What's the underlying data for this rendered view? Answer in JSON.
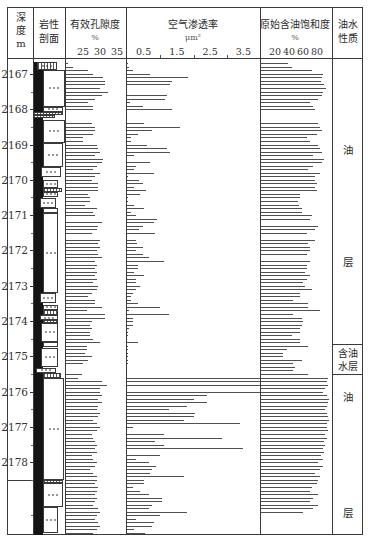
{
  "header": {
    "depth": {
      "line1": "深",
      "line2": "度",
      "unit": "m"
    },
    "lithology": {
      "line1": "岩性",
      "line2": "剖面"
    },
    "porosity": {
      "title": "有效孔隙度",
      "unit": "%"
    },
    "permeability": {
      "title": "空气渗透率",
      "unit": "μm²"
    },
    "saturation": {
      "title": "原始含油饱和度",
      "unit": "%"
    },
    "fluid": {
      "line1": "油水",
      "line2": "性质"
    }
  },
  "chart_data": {
    "type": "bar",
    "orientation": "horizontal",
    "layout": "well-log",
    "title": "",
    "ylabel": "深度 (m)",
    "depth_range": [
      2166.55,
      2180.06
    ],
    "depth_ticks": [
      2167,
      2168,
      2169,
      2170,
      2171,
      2172,
      2173,
      2174,
      2175,
      2176,
      2177,
      2178
    ],
    "depth_minor_step": 0.5,
    "section_break_depth": 2178.5,
    "sample_start": 2166.6,
    "sample_step": 0.1,
    "grid": false,
    "tracks": [
      {
        "key": "porosity",
        "name": "有效孔隙度",
        "unit": "%",
        "scale": [
          20,
          37.6
        ],
        "ticks": [
          25,
          30,
          35
        ],
        "tick_labels": [
          "25",
          "30",
          "35"
        ],
        "values": [
          null,
          20.6,
          22.1,
          26.5,
          27.9,
          30.9,
          31.5,
          31.5,
          30.0,
          32.4,
          30.6,
          28.5,
          26.5,
          27.9,
          27.9,
          null,
          null,
          null,
          27.6,
          28.5,
          28.5,
          27.9,
          25.0,
          25.0,
          29.1,
          29.4,
          30.0,
          28.5,
          30.9,
          30.6,
          29.1,
          27.9,
          30.0,
          28.5,
          27.6,
          29.4,
          29.4,
          29.4,
          26.5,
          27.1,
          27.1,
          25.6,
          29.1,
          27.9,
          28.5,
          null,
          30.6,
          29.4,
          29.1,
          27.6,
          null,
          30.0,
          29.4,
          30.0,
          29.1,
          29.4,
          30.6,
          28.5,
          29.1,
          28.5,
          29.1,
          28.5,
          29.1,
          27.9,
          29.4,
          29.1,
          27.6,
          26.5,
          28.5,
          28.5,
          30.6,
          26.2,
          31.5,
          31.5,
          27.6,
          27.1,
          27.6,
          27.1,
          27.1,
          27.9,
          30.0,
          26.2,
          26.2,
          25.6,
          27.6,
          26.5,
          25.0,
          null,
          null,
          24.7,
          23.5,
          30.6,
          32.1,
          30.0,
          30.0,
          30.6,
          29.4,
          30.6,
          29.4,
          29.1,
          30.0,
          29.4,
          27.9,
          29.1,
          30.0,
          29.1,
          27.6,
          27.9,
          28.5,
          29.1,
          28.5,
          29.1,
          27.6,
          27.9,
          29.1,
          28.5,
          27.1,
          27.9,
          29.1,
          29.1,
          28.5,
          29.4,
          29.1,
          28.5,
          29.1,
          28.5,
          27.9,
          29.4,
          30.0,
          29.1,
          28.5,
          29.4,
          30.0,
          29.1,
          27.9
        ]
      },
      {
        "key": "permeability",
        "name": "空气渗透率",
        "unit": "μm²",
        "scale": [
          0,
          4.0
        ],
        "ticks": [
          0.5,
          1.5,
          2.5,
          3.5
        ],
        "tick_labels": [
          "0.5",
          "1.5",
          "2.5",
          "3.5"
        ],
        "minor_ticks": [
          1,
          2,
          3
        ],
        "values": [
          null,
          0.03,
          0.06,
          0.17,
          0.7,
          1.83,
          1.35,
          1.3,
          null,
          null,
          1.2,
          1.15,
          0.1,
          0.47,
          1.35,
          null,
          null,
          null,
          0.5,
          1.6,
          0.75,
          0.32,
          0.12,
          0.12,
          0.6,
          1.2,
          1.3,
          0.2,
          null,
          0.7,
          0.26,
          0.2,
          0.8,
          0.03,
          0.35,
          0.47,
          0.2,
          0.58,
          0.4,
          0.03,
          0.03,
          0.2,
          0.5,
          0.12,
          0.26,
          0.9,
          0.8,
          0.47,
          0.35,
          0.85,
          null,
          0.26,
          0.3,
          0.47,
          0.26,
          0.47,
          0.65,
          1.1,
          0.32,
          0.32,
          0.2,
          0.5,
          0.26,
          0.26,
          0.4,
          0.26,
          0.17,
          0.12,
          0.12,
          0.32,
          1.0,
          0.06,
          1.25,
          0.17,
          0.17,
          0.17,
          0.06,
          0.03,
          0.03,
          null,
          0.32,
          0.03,
          0.03,
          0.03,
          0.03,
          0.03,
          0.03,
          null,
          null,
          null,
          4.0,
          4.0,
          4.0,
          null,
          4.0,
          2.4,
          2.0,
          2.4,
          1.8,
          1.25,
          2.05,
          2.0,
          1.7,
          3.4,
          0.17,
          null,
          1.1,
          2.85,
          0.85,
          1.1,
          3.5,
          null,
          1.0,
          0.26,
          0.65,
          0.88,
          0.75,
          0.68,
          1.7,
          0.5,
          0.5,
          0.17,
          0.38,
          0.65,
          1.05,
          1.05,
          0.75,
          0.65,
          1.8,
          1.0,
          0.26,
          0.8,
          0.75,
          0.2,
          0.55
        ]
      },
      {
        "key": "saturation",
        "name": "原始含油饱和度",
        "unit": "%",
        "scale": [
          0,
          100
        ],
        "ticks": [
          20,
          40,
          60,
          80
        ],
        "tick_labels": [
          "20",
          "40",
          "60",
          "80"
        ],
        "values": [
          null,
          38.6,
          44,
          73,
          89,
          87,
          85,
          90,
          93,
          89,
          87,
          82,
          70,
          74,
          77,
          null,
          null,
          null,
          82,
          84,
          87,
          80,
          66,
          70,
          82,
          84,
          87,
          74,
          90,
          87,
          74,
          67,
          84,
          77,
          77,
          80,
          77,
          80,
          56,
          56,
          53,
          54,
          59,
          59,
          73,
          70,
          null,
          82,
          77,
          66,
          null,
          77,
          67,
          70,
          70,
          66,
          null,
          70,
          66,
          66,
          63,
          70,
          66,
          60,
          63,
          73,
          56,
          56,
          46,
          67,
          67,
          84,
          46,
          59,
          60,
          59,
          56,
          56,
          44,
          56,
          56,
          67,
          37,
          31,
          31,
          59,
          46,
          49,
          46,
          67,
          96,
          94,
          96,
          91,
          89,
          94,
          97,
          96,
          94,
          91,
          94,
          96,
          97,
          94,
          94,
          96,
          92,
          94,
          90,
          92,
          88,
          90,
          86,
          88,
          81,
          89,
          84,
          77,
          84,
          81,
          80,
          73,
          70,
          81,
          74,
          70,
          81,
          74,
          60,
          null,
          null,
          null,
          null,
          null,
          null
        ]
      }
    ],
    "lithology": {
      "mud_strip": {
        "top": 2166.66,
        "bottom": 2180.06
      },
      "segments": [
        {
          "top": 2166.66,
          "bottom": 2166.89,
          "x": [
            4,
            24
          ],
          "pattern": "hatched-dots"
        },
        {
          "top": 2166.89,
          "bottom": 2167.93,
          "x": [
            10,
            32
          ],
          "pattern": "dots"
        },
        {
          "top": 2167.93,
          "bottom": 2168.08,
          "x": [
            10,
            30
          ],
          "pattern": "dots"
        },
        {
          "top": 2168.08,
          "bottom": 2168.16,
          "x": [
            0,
            30
          ],
          "pattern": "hatched"
        },
        {
          "top": 2168.16,
          "bottom": 2168.25,
          "x": [
            0,
            22
          ],
          "pattern": "hatched"
        },
        {
          "top": 2168.3,
          "bottom": 2168.95,
          "x": [
            10,
            32
          ],
          "pattern": "dots"
        },
        {
          "top": 2168.95,
          "bottom": 2169.63,
          "x": [
            10,
            30
          ],
          "pattern": "dots"
        },
        {
          "top": 2169.63,
          "bottom": 2169.92,
          "x": [
            8,
            28
          ],
          "pattern": "dots"
        },
        {
          "top": 2170.0,
          "bottom": 2170.23,
          "x": [
            10,
            25
          ],
          "pattern": "dots"
        },
        {
          "top": 2170.23,
          "bottom": 2170.34,
          "x": [
            10,
            29
          ],
          "pattern": "hatched"
        },
        {
          "top": 2170.34,
          "bottom": 2170.48,
          "x": [
            10,
            25
          ],
          "pattern": "dots"
        },
        {
          "top": 2170.51,
          "bottom": 2170.8,
          "x": [
            7,
            23
          ],
          "pattern": "dots"
        },
        {
          "top": 2170.8,
          "bottom": 2170.94,
          "x": [
            10,
            25
          ],
          "pattern": "plain"
        },
        {
          "top": 2170.94,
          "bottom": 2173.2,
          "x": [
            10,
            25
          ],
          "pattern": "dots"
        },
        {
          "top": 2173.2,
          "bottom": 2173.49,
          "x": [
            7,
            23
          ],
          "pattern": "dots"
        },
        {
          "top": 2173.54,
          "bottom": 2173.69,
          "x": [
            10,
            25
          ],
          "pattern": "dots"
        },
        {
          "top": 2173.69,
          "bottom": 2173.83,
          "x": [
            10,
            25
          ],
          "pattern": "hatched"
        },
        {
          "top": 2173.83,
          "bottom": 2173.97,
          "x": [
            7,
            25
          ],
          "pattern": "dots"
        },
        {
          "top": 2173.97,
          "bottom": 2174.05,
          "x": [
            10,
            25
          ],
          "pattern": "hatched"
        },
        {
          "top": 2174.05,
          "bottom": 2174.59,
          "x": [
            8,
            25
          ],
          "pattern": "dots"
        },
        {
          "top": 2174.59,
          "bottom": 2174.73,
          "x": [
            10,
            25
          ],
          "pattern": "plain"
        },
        {
          "top": 2174.76,
          "bottom": 2175.3,
          "x": [
            8,
            25
          ],
          "pattern": "dots"
        },
        {
          "top": 2175.33,
          "bottom": 2175.47,
          "x": [
            3,
            23
          ],
          "pattern": "dots"
        },
        {
          "top": 2175.47,
          "bottom": 2175.61,
          "x": [
            10,
            28
          ],
          "pattern": "hatched"
        },
        {
          "top": 2175.61,
          "bottom": 2178.5,
          "x": [
            10,
            31
          ],
          "pattern": "dots"
        },
        {
          "top": 2178.5,
          "bottom": 2178.59,
          "x": [
            10,
            30
          ],
          "pattern": "hatched"
        },
        {
          "top": 2178.59,
          "bottom": 2179.27,
          "x": [
            10,
            30
          ],
          "pattern": "dots"
        },
        {
          "top": 2179.27,
          "bottom": 2180.0,
          "x": [
            10,
            25
          ],
          "pattern": "dots"
        }
      ]
    },
    "fluid_nature": [
      {
        "top": 2166.55,
        "bottom": 2174.68,
        "label": "油层",
        "chars": [
          "油",
          "层"
        ],
        "label_positions": [
          0.32,
          0.71
        ]
      },
      {
        "top": 2174.68,
        "bottom": 2175.53,
        "label": "含油水层",
        "lines": [
          "含油",
          "水层"
        ]
      },
      {
        "top": 2175.53,
        "bottom": 2180.06,
        "label": "油层",
        "chars": [
          "油",
          "层"
        ],
        "label_positions": [
          0.14,
          0.86
        ]
      }
    ]
  }
}
